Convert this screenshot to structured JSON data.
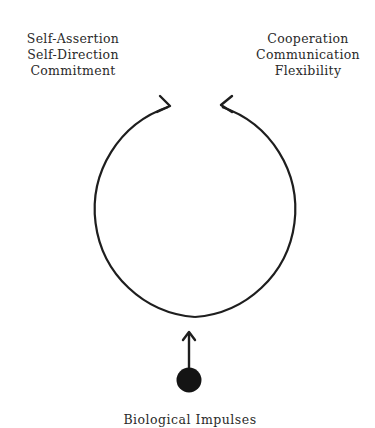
{
  "diagram": {
    "left_labels": [
      "Self-Assertion",
      "Self-Direction",
      "Commitment"
    ],
    "right_labels": [
      "Cooperation",
      "Communication",
      "Flexibility"
    ],
    "bottom_label": "Biological Impulses",
    "stroke_color": "#1e1e1e",
    "elements": {
      "circle": "open circular loop with two arrowheads at top pointing toward each other",
      "source": "filled black dot with upward arrow into bottom of loop"
    }
  }
}
